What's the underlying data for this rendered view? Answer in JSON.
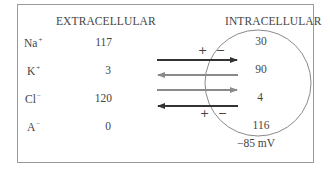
{
  "headers": {
    "extracellular": "EXTRACELLULAR",
    "intracellular": "INTRACELLULAR"
  },
  "ions": [
    {
      "symbol": "Na",
      "charge": "+",
      "extracellular": "117",
      "intracellular": "30",
      "arrow_direction": "inward",
      "arrow_color": "#333333"
    },
    {
      "symbol": "K",
      "charge": "+",
      "extracellular": "3",
      "intracellular": "90",
      "arrow_direction": "outward",
      "arrow_color": "#8a8a8a"
    },
    {
      "symbol": "Cl",
      "charge": "−",
      "extracellular": "120",
      "intracellular": "4",
      "arrow_direction": "inward",
      "arrow_color": "#8a8a8a"
    },
    {
      "symbol": "A",
      "charge": "−",
      "extracellular": "0",
      "intracellular": "116",
      "arrow_direction": "outward",
      "arrow_color": "#333333"
    }
  ],
  "membrane": {
    "top_plus": "+",
    "top_minus": "−",
    "bottom_plus": "+",
    "bottom_minus": "−"
  },
  "membrane_potential": "−85 mV"
}
